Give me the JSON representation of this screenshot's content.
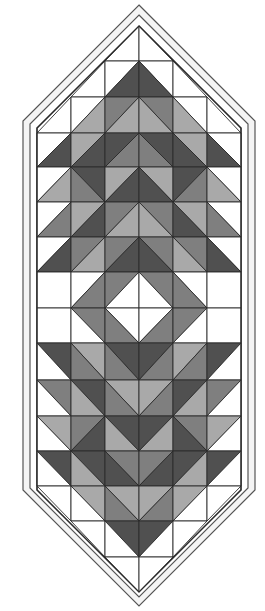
{
  "colors": {
    "W": "#ffffff",
    "L": "#a9a9a9",
    "M": "#7f7f7f",
    "D": "#505050",
    "line": "#2a2a2a",
    "border_line": "#555555",
    "border_fill": "#f4f4f4"
  },
  "grid": {
    "x0": 37,
    "cell_w": 34,
    "cols": 6,
    "rows_y": [
      26,
      61,
      97,
      133,
      167,
      202,
      237,
      272,
      308,
      343,
      380,
      416,
      451,
      486,
      521,
      557,
      592
    ]
  },
  "outline": {
    "outer": [
      [
        139,
        5
      ],
      [
        255,
        121
      ],
      [
        255,
        490
      ],
      [
        139,
        606
      ],
      [
        23,
        490
      ],
      [
        23,
        121
      ]
    ],
    "strip": [
      [
        139,
        15
      ],
      [
        248,
        124
      ],
      [
        248,
        488
      ],
      [
        139,
        597
      ],
      [
        30,
        488
      ],
      [
        30,
        124
      ]
    ],
    "grid": [
      [
        139,
        26
      ],
      [
        241,
        128
      ],
      [
        241,
        490
      ],
      [
        139,
        592
      ],
      [
        37,
        490
      ],
      [
        37,
        128
      ]
    ]
  },
  "cells": [
    [
      null,
      null,
      {
        "d": "/",
        "a": "X",
        "b": "W"
      },
      {
        "d": "\\",
        "a": "X",
        "b": "W"
      },
      null,
      null
    ],
    [
      null,
      {
        "d": "/",
        "a": "X",
        "b": "W"
      },
      {
        "d": "/",
        "a": "W",
        "b": "D"
      },
      {
        "d": "\\",
        "a": "W",
        "b": "D"
      },
      {
        "d": "\\",
        "a": "X",
        "b": "W"
      },
      null
    ],
    [
      {
        "d": "/",
        "a": "X",
        "b": "W"
      },
      {
        "d": "/",
        "a": "W",
        "b": "L"
      },
      {
        "d": "/",
        "a": "M",
        "b": "L"
      },
      {
        "d": "\\",
        "a": "M",
        "b": "L"
      },
      {
        "d": "\\",
        "a": "W",
        "b": "L"
      },
      {
        "d": "\\",
        "a": "X",
        "b": "W"
      }
    ],
    [
      {
        "d": "/",
        "a": "W",
        "b": "D"
      },
      {
        "d": "/",
        "a": "L",
        "b": "D"
      },
      {
        "d": "/",
        "a": "D",
        "b": "M"
      },
      {
        "d": "\\",
        "a": "D",
        "b": "M"
      },
      {
        "d": "\\",
        "a": "L",
        "b": "D"
      },
      {
        "d": "\\",
        "a": "W",
        "b": "D"
      }
    ],
    [
      {
        "d": "/",
        "a": "W",
        "b": "L"
      },
      {
        "d": "\\",
        "a": "D",
        "b": "M"
      },
      {
        "d": "/",
        "a": "L",
        "b": "D"
      },
      {
        "d": "\\",
        "a": "L",
        "b": "D"
      },
      {
        "d": "/",
        "a": "D",
        "b": "M"
      },
      {
        "d": "\\",
        "a": "W",
        "b": "L"
      }
    ],
    [
      {
        "d": "/",
        "a": "W",
        "b": "M"
      },
      {
        "d": "/",
        "a": "L",
        "b": "D"
      },
      {
        "d": "/",
        "a": "M",
        "b": "L"
      },
      {
        "d": "\\",
        "a": "M",
        "b": "L"
      },
      {
        "d": "\\",
        "a": "L",
        "b": "D"
      },
      {
        "d": "\\",
        "a": "W",
        "b": "M"
      }
    ],
    [
      {
        "d": "/",
        "a": "W",
        "b": "D"
      },
      {
        "d": "/",
        "a": "M",
        "b": "L"
      },
      {
        "d": "/",
        "a": "M",
        "b": "D"
      },
      {
        "d": "\\",
        "a": "M",
        "b": "D"
      },
      {
        "d": "\\",
        "a": "M",
        "b": "L"
      },
      {
        "d": "\\",
        "a": "W",
        "b": "D"
      }
    ],
    [
      {
        "d": "s",
        "a": "W"
      },
      {
        "d": "/",
        "a": "W",
        "b": "M"
      },
      {
        "d": "/",
        "a": "M",
        "b": "W"
      },
      {
        "d": "\\",
        "a": "M",
        "b": "W"
      },
      {
        "d": "\\",
        "a": "W",
        "b": "M"
      },
      {
        "d": "s",
        "a": "W"
      }
    ],
    [
      {
        "d": "s",
        "a": "W"
      },
      {
        "d": "\\",
        "a": "M",
        "b": "W"
      },
      {
        "d": "\\",
        "a": "W",
        "b": "M"
      },
      {
        "d": "/",
        "a": "W",
        "b": "M"
      },
      {
        "d": "/",
        "a": "M",
        "b": "W"
      },
      {
        "d": "s",
        "a": "W"
      }
    ],
    [
      {
        "d": "\\",
        "a": "D",
        "b": "W"
      },
      {
        "d": "\\",
        "a": "L",
        "b": "M"
      },
      {
        "d": "\\",
        "a": "D",
        "b": "M"
      },
      {
        "d": "/",
        "a": "D",
        "b": "M"
      },
      {
        "d": "/",
        "a": "L",
        "b": "M"
      },
      {
        "d": "/",
        "a": "D",
        "b": "W"
      }
    ],
    [
      {
        "d": "\\",
        "a": "M",
        "b": "W"
      },
      {
        "d": "\\",
        "a": "D",
        "b": "L"
      },
      {
        "d": "\\",
        "a": "L",
        "b": "M"
      },
      {
        "d": "/",
        "a": "L",
        "b": "M"
      },
      {
        "d": "/",
        "a": "D",
        "b": "L"
      },
      {
        "d": "/",
        "a": "M",
        "b": "W"
      }
    ],
    [
      {
        "d": "\\",
        "a": "L",
        "b": "W"
      },
      {
        "d": "/",
        "a": "M",
        "b": "D"
      },
      {
        "d": "\\",
        "a": "D",
        "b": "L"
      },
      {
        "d": "/",
        "a": "D",
        "b": "L"
      },
      {
        "d": "\\",
        "a": "M",
        "b": "D"
      },
      {
        "d": "/",
        "a": "L",
        "b": "W"
      }
    ],
    [
      {
        "d": "\\",
        "a": "D",
        "b": "W"
      },
      {
        "d": "\\",
        "a": "D",
        "b": "L"
      },
      {
        "d": "\\",
        "a": "M",
        "b": "D"
      },
      {
        "d": "/",
        "a": "M",
        "b": "D"
      },
      {
        "d": "/",
        "a": "D",
        "b": "L"
      },
      {
        "d": "/",
        "a": "D",
        "b": "W"
      }
    ],
    [
      {
        "d": "\\",
        "a": "W",
        "b": "X"
      },
      {
        "d": "\\",
        "a": "L",
        "b": "W"
      },
      {
        "d": "\\",
        "a": "L",
        "b": "M"
      },
      {
        "d": "/",
        "a": "L",
        "b": "M"
      },
      {
        "d": "/",
        "a": "L",
        "b": "W"
      },
      {
        "d": "/",
        "a": "W",
        "b": "X"
      }
    ],
    [
      null,
      {
        "d": "\\",
        "a": "W",
        "b": "X"
      },
      {
        "d": "\\",
        "a": "D",
        "b": "W"
      },
      {
        "d": "/",
        "a": "D",
        "b": "W"
      },
      {
        "d": "/",
        "a": "W",
        "b": "X"
      },
      null
    ],
    [
      null,
      null,
      {
        "d": "\\",
        "a": "W",
        "b": "X"
      },
      {
        "d": "/",
        "a": "W",
        "b": "X"
      },
      null,
      null
    ]
  ]
}
